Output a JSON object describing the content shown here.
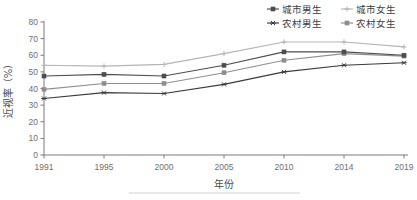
{
  "chart_data": {
    "type": "line",
    "title": "",
    "xlabel": "年份",
    "ylabel": "近视率（%）",
    "categories": [
      "1991",
      "1995",
      "2000",
      "2005",
      "2010",
      "2014",
      "2019"
    ],
    "x": [
      1991,
      1995,
      2000,
      2005,
      2010,
      2014,
      2019
    ],
    "ylim": [
      0,
      80
    ],
    "yticks": [
      "0",
      "10",
      "20",
      "30",
      "40",
      "50",
      "60",
      "70",
      "80"
    ],
    "ytick_values": [
      0,
      10,
      20,
      30,
      40,
      50,
      60,
      70,
      80
    ],
    "grid": false,
    "legend_position": "top-right",
    "series": [
      {
        "name": "城市男生",
        "values": [
          47.5,
          48.5,
          47.5,
          54.0,
          62.0,
          62.0,
          60.0
        ],
        "color": "#4d4d4d",
        "marker": "square"
      },
      {
        "name": "城市女生",
        "values": [
          54.0,
          53.5,
          54.5,
          61.0,
          68.0,
          68.0,
          65.0
        ],
        "color": "#b5b5b5",
        "marker": "plus"
      },
      {
        "name": "农村男生",
        "values": [
          34.0,
          37.5,
          37.0,
          42.5,
          50.0,
          54.0,
          55.5
        ],
        "color": "#3a3a3a",
        "marker": "asterisk"
      },
      {
        "name": "农村女生",
        "values": [
          39.5,
          43.0,
          43.0,
          49.5,
          57.0,
          61.0,
          59.5
        ],
        "color": "#8e8e8e",
        "marker": "square"
      }
    ]
  },
  "legend": {
    "entries": [
      {
        "label": "城市男生"
      },
      {
        "label": "城市女生"
      },
      {
        "label": "农村男生"
      },
      {
        "label": "农村女生"
      }
    ]
  },
  "axes": {
    "y_title": "近视率（%）",
    "x_title": "年份"
  }
}
